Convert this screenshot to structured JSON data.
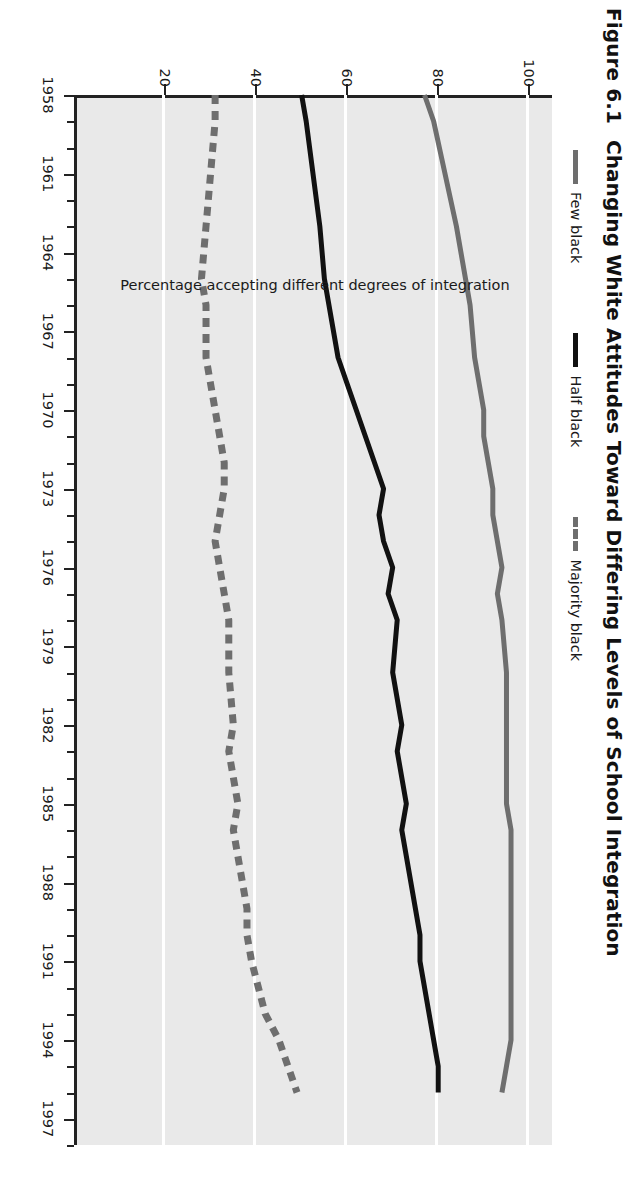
{
  "figure": {
    "number": "Figure 6.1",
    "title": "Changing White Attitudes Toward Differing Levels of School Integration"
  },
  "colors": {
    "few_black": "#6e6e6e",
    "half_black": "#111111",
    "majority_black": "#6e6e6e",
    "plot_background": "#e9e9e9",
    "gridline": "#ffffff",
    "axis": "#222222"
  },
  "legend": {
    "position": "top",
    "items": [
      {
        "label": "Few black",
        "style": "solid",
        "color": "#6e6e6e",
        "icon": "line-solid-gray-icon"
      },
      {
        "label": "Half black",
        "style": "solid",
        "color": "#111111",
        "icon": "line-solid-black-icon"
      },
      {
        "label": "Majority black",
        "style": "dashed",
        "color": "#6e6e6e",
        "icon": "line-dashed-gray-icon"
      }
    ]
  },
  "axes": {
    "y": {
      "label": "Percentage accepting different degrees of integration",
      "ticks": [
        20,
        40,
        60,
        80,
        100
      ],
      "min": 0,
      "max": 105
    },
    "x": {
      "label": "",
      "ticks": [
        1958,
        1961,
        1964,
        1967,
        1970,
        1973,
        1976,
        1979,
        1982,
        1985,
        1988,
        1991,
        1994,
        1997
      ],
      "min": 1958,
      "max": 1998
    }
  },
  "chart_data": {
    "type": "line",
    "xlabel": "",
    "ylabel": "Percentage accepting different degrees of integration",
    "xlim": [
      1958,
      1998
    ],
    "ylim": [
      0,
      105
    ],
    "grid": true,
    "legend_position": "top",
    "x": [
      1958,
      1959,
      1963,
      1965,
      1966,
      1968,
      1969,
      1970,
      1971,
      1972,
      1973,
      1974,
      1975,
      1976,
      1977,
      1978,
      1980,
      1982,
      1983,
      1985,
      1986,
      1988,
      1989,
      1990,
      1991,
      1993,
      1994,
      1995,
      1996
    ],
    "series": [
      {
        "name": "Few black",
        "style": "solid",
        "color": "#6e6e6e",
        "values": [
          77,
          79,
          84,
          86,
          87,
          88,
          89,
          90,
          90,
          91,
          92,
          92,
          93,
          94,
          93,
          94,
          95,
          95,
          95,
          95,
          96,
          96,
          96,
          96,
          96,
          96,
          96,
          95,
          94
        ]
      },
      {
        "name": "Half black",
        "style": "solid",
        "color": "#111111",
        "values": [
          50,
          51,
          54,
          55,
          56,
          58,
          60,
          62,
          64,
          66,
          68,
          67,
          68,
          70,
          69,
          71,
          70,
          72,
          71,
          73,
          72,
          74,
          75,
          76,
          76,
          78,
          79,
          80,
          80
        ]
      },
      {
        "name": "Majority black",
        "style": "dashed",
        "color": "#6e6e6e",
        "values": [
          31,
          31,
          29,
          28,
          29,
          29,
          30,
          31,
          32,
          33,
          33,
          32,
          31,
          32,
          33,
          34,
          34,
          35,
          34,
          36,
          35,
          37,
          38,
          38,
          39,
          42,
          45,
          47,
          49
        ]
      }
    ]
  }
}
